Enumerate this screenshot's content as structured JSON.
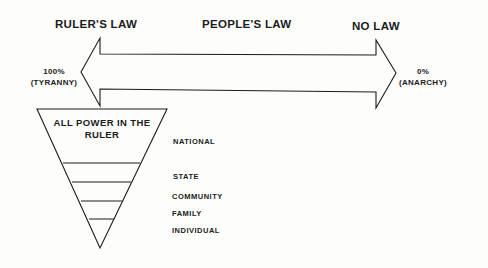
{
  "headers": {
    "left": "RULER'S LAW",
    "center": "PEOPLE'S LAW",
    "right": "NO LAW"
  },
  "scale": {
    "left_value": "100%",
    "left_label": "(TYRANNY)",
    "right_value": "0%",
    "right_label": "(ANARCHY)"
  },
  "pyramid": {
    "apex_line1": "ALL POWER IN THE",
    "apex_line2": "RULER",
    "levels": [
      "NATIONAL",
      "STATE",
      "COMMUNITY",
      "FAMILY",
      "INDIVIDUAL"
    ]
  },
  "colors": {
    "ink": "#1c1c1c",
    "background": "#fdfdfc"
  }
}
